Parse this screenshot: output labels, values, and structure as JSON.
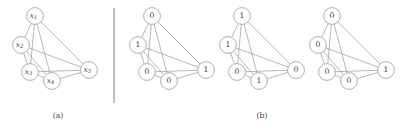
{
  "figure": {
    "width": 414,
    "height": 133,
    "background_color": "#ffffff",
    "stroke_color": "#9a9a9a",
    "text_color": "#3a3a3a",
    "divider_color": "#8c8c8c"
  },
  "panels": [
    {
      "caption": "(a)",
      "caption_x": 58,
      "caption_y": 116,
      "origin_x": 0,
      "origin_y": 0,
      "label_style": "variable",
      "nodes": [
        {
          "id": "x1",
          "label": "x",
          "subscript": "1",
          "cx": 35,
          "cy": 16,
          "r": 8.4
        },
        {
          "id": "x2",
          "label": "x",
          "subscript": "2",
          "cx": 21,
          "cy": 45,
          "r": 8.4
        },
        {
          "id": "x3",
          "label": "x",
          "subscript": "3",
          "cx": 30,
          "cy": 72,
          "r": 8.4
        },
        {
          "id": "x4",
          "label": "x",
          "subscript": "4",
          "cx": 52,
          "cy": 81,
          "r": 8.4
        },
        {
          "id": "x5",
          "label": "x",
          "subscript": "5",
          "cx": 89,
          "cy": 70,
          "r": 8.4
        }
      ]
    },
    {
      "caption": "",
      "caption_x": 0,
      "caption_y": 0,
      "origin_x": 117,
      "origin_y": 0,
      "label_style": "value",
      "nodes": [
        {
          "id": "x1",
          "label": "0",
          "subscript": "",
          "cx": 152,
          "cy": 16,
          "r": 8.4
        },
        {
          "id": "x2",
          "label": "1",
          "subscript": "",
          "cx": 138,
          "cy": 45,
          "r": 8.4
        },
        {
          "id": "x3",
          "label": "0",
          "subscript": "",
          "cx": 147,
          "cy": 72,
          "r": 8.4
        },
        {
          "id": "x4",
          "label": "0",
          "subscript": "",
          "cx": 169,
          "cy": 81,
          "r": 8.4
        },
        {
          "id": "x5",
          "label": "1",
          "subscript": "",
          "cx": 206,
          "cy": 70,
          "r": 8.4
        }
      ]
    },
    {
      "caption": "(b)",
      "caption_x": 262,
      "caption_y": 116,
      "origin_x": 207,
      "origin_y": 0,
      "label_style": "value",
      "nodes": [
        {
          "id": "x1",
          "label": "1",
          "subscript": "",
          "cx": 242,
          "cy": 16,
          "r": 8.4
        },
        {
          "id": "x2",
          "label": "1",
          "subscript": "",
          "cx": 228,
          "cy": 45,
          "r": 8.4
        },
        {
          "id": "x3",
          "label": "0",
          "subscript": "",
          "cx": 237,
          "cy": 72,
          "r": 8.4
        },
        {
          "id": "x4",
          "label": "1",
          "subscript": "",
          "cx": 259,
          "cy": 81,
          "r": 8.4
        },
        {
          "id": "x5",
          "label": "0",
          "subscript": "",
          "cx": 296,
          "cy": 70,
          "r": 8.4
        }
      ]
    },
    {
      "caption": "",
      "caption_x": 0,
      "caption_y": 0,
      "origin_x": 297,
      "origin_y": 0,
      "label_style": "value",
      "nodes": [
        {
          "id": "x1",
          "label": "0",
          "subscript": "",
          "cx": 332,
          "cy": 16,
          "r": 8.4
        },
        {
          "id": "x2",
          "label": "0",
          "subscript": "",
          "cx": 318,
          "cy": 45,
          "r": 8.4
        },
        {
          "id": "x3",
          "label": "0",
          "subscript": "",
          "cx": 327,
          "cy": 72,
          "r": 8.4
        },
        {
          "id": "x4",
          "label": "0",
          "subscript": "",
          "cx": 349,
          "cy": 81,
          "r": 8.4
        },
        {
          "id": "x5",
          "label": "1",
          "subscript": "",
          "cx": 386,
          "cy": 70,
          "r": 8.4
        }
      ]
    }
  ],
  "edges": [
    [
      "x1",
      "x2"
    ],
    [
      "x1",
      "x3"
    ],
    [
      "x1",
      "x4"
    ],
    [
      "x1",
      "x5"
    ],
    [
      "x2",
      "x3"
    ],
    [
      "x2",
      "x4"
    ],
    [
      "x2",
      "x5"
    ],
    [
      "x3",
      "x4"
    ],
    [
      "x3",
      "x5"
    ],
    [
      "x4",
      "x5"
    ]
  ],
  "divider": {
    "x": 114,
    "y_top": 8,
    "y_bottom": 103
  }
}
